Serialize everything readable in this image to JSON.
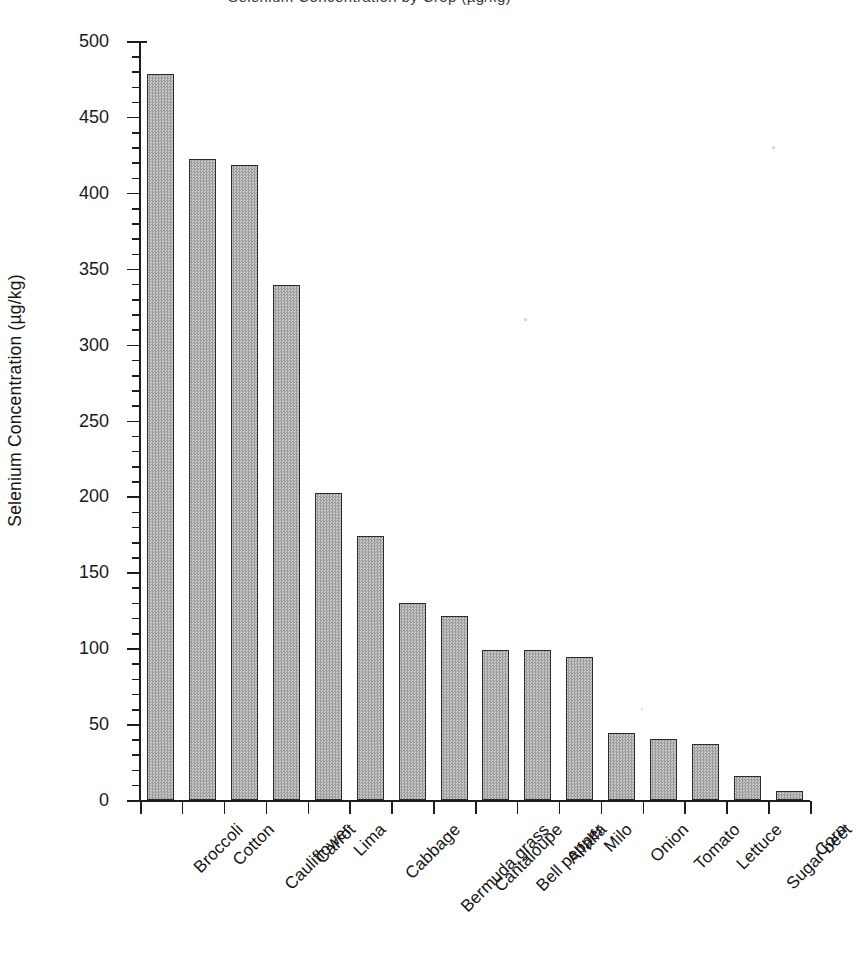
{
  "figure": {
    "title_cropped": "Selenium Concentration by Crop (µg/kg)",
    "ylabel": "Selenium Concentration (µg/kg)",
    "xlabel": "",
    "bar_fill_color": "#b4b4b4",
    "bar_edge_color": "#2b2b2b",
    "axis_color": "#1d1d1d",
    "background_color": "#ffffff"
  },
  "chart_data": {
    "type": "bar",
    "title": "Selenium Concentration by Crop (µg/kg)",
    "xlabel": "",
    "ylabel": "Selenium Concentration (µg/kg)",
    "ylim": [
      0,
      500
    ],
    "ytick_interval": 50,
    "yminor_tick_interval": 10,
    "grid": false,
    "legend": false,
    "orientation": "vertical",
    "sorted": "descending",
    "categories": [
      "Broccoli",
      "Cotton",
      "Cauliflower",
      "Carrot",
      "Lima",
      "Cabbage",
      "Bermuda grass",
      "Cantaloupe",
      "Bell pepper",
      "Alfalfa",
      "Milo",
      "Onion",
      "Tomato",
      "Lettuce",
      "Sugar beet",
      "Corn"
    ],
    "values": [
      478,
      422,
      418,
      339,
      202,
      174,
      130,
      121,
      99,
      99,
      94,
      44,
      40,
      37,
      16,
      6
    ],
    "yticks": [
      0,
      50,
      100,
      150,
      200,
      250,
      300,
      350,
      400,
      450,
      500
    ],
    "ytick_labels": [
      "0",
      "50",
      "100",
      "150",
      "200",
      "250",
      "300",
      "350",
      "400",
      "450",
      "500"
    ],
    "units": "µg/kg"
  }
}
